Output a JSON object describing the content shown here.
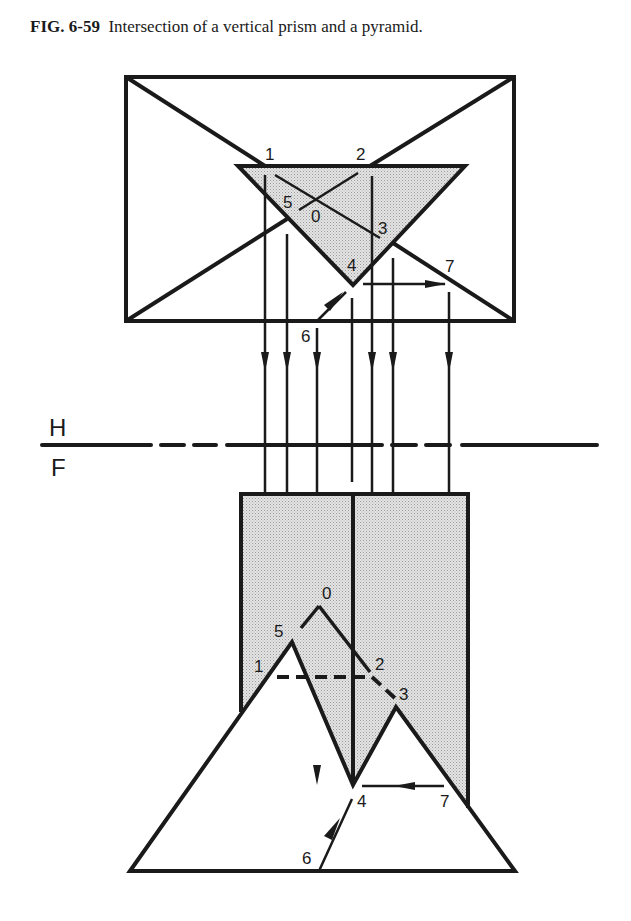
{
  "caption": {
    "figure_number": "FIG. 6-59",
    "text": "Intersection of a vertical prism and a pyramid."
  },
  "colors": {
    "ink": "#1a1a1a",
    "shade": "#d6d6d6",
    "background": "#ffffff"
  },
  "fold_line": {
    "top_label": "H",
    "bottom_label": "F"
  },
  "top_view": {
    "labels": {
      "p1": "1",
      "p2": "2",
      "p3": "3",
      "p4": "4",
      "p5": "5",
      "p0": "0",
      "p6": "6",
      "p7": "7"
    }
  },
  "front_view": {
    "labels": {
      "p0": "0",
      "p5": "5",
      "p1": "1",
      "p2": "2",
      "p3": "3",
      "p4": "4",
      "p7": "7",
      "p6": "6"
    }
  }
}
